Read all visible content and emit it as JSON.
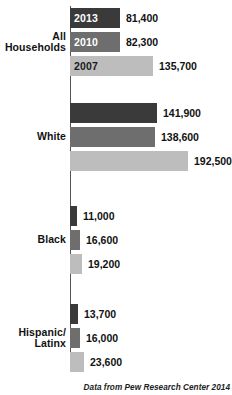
{
  "chart_data": {
    "type": "bar",
    "title": "",
    "xlabel": "",
    "ylabel": "",
    "orientation": "horizontal",
    "grid": false,
    "legend": "none",
    "xlim": [
      0,
      192500
    ],
    "categories": [
      "All Households",
      "White",
      "Black",
      "Hispanic/Latinx"
    ],
    "series": [
      {
        "name": "2013",
        "color": "#3a3a3a",
        "values": [
          81400,
          141900,
          11000,
          13700
        ]
      },
      {
        "name": "2010",
        "color": "#6e6e6e",
        "values": [
          82300,
          138600,
          16600,
          16000
        ]
      },
      {
        "name": "2007",
        "color": "#bdbdbd",
        "values": [
          135700,
          192500,
          19200,
          23600
        ]
      }
    ],
    "source_note": "Data from Pew Research Center 2014"
  },
  "groups": [
    {
      "label_lines": [
        "All",
        "Households"
      ],
      "bars": [
        {
          "year": "2013",
          "value_label": "81,400",
          "value": 81400,
          "color": "#3a3a3a",
          "year_label_color": "#ffffff",
          "show_year": true
        },
        {
          "year": "2010",
          "value_label": "82,300",
          "value": 82300,
          "color": "#6e6e6e",
          "year_label_color": "#ffffff",
          "show_year": true
        },
        {
          "year": "2007",
          "value_label": "135,700",
          "value": 135700,
          "color": "#bdbdbd",
          "year_label_color": "#1a1a1a",
          "show_year": true
        }
      ]
    },
    {
      "label_lines": [
        "White"
      ],
      "bars": [
        {
          "year": "2013",
          "value_label": "141,900",
          "value": 141900,
          "color": "#3a3a3a",
          "year_label_color": "#ffffff",
          "show_year": false
        },
        {
          "year": "2010",
          "value_label": "138,600",
          "value": 138600,
          "color": "#6e6e6e",
          "year_label_color": "#ffffff",
          "show_year": false
        },
        {
          "year": "2007",
          "value_label": "192,500",
          "value": 192500,
          "color": "#bdbdbd",
          "year_label_color": "#1a1a1a",
          "show_year": false
        }
      ]
    },
    {
      "label_lines": [
        "Black"
      ],
      "bars": [
        {
          "year": "2013",
          "value_label": "11,000",
          "value": 11000,
          "color": "#3a3a3a",
          "year_label_color": "#ffffff",
          "show_year": false
        },
        {
          "year": "2010",
          "value_label": "16,600",
          "value": 16600,
          "color": "#6e6e6e",
          "year_label_color": "#ffffff",
          "show_year": false
        },
        {
          "year": "2007",
          "value_label": "19,200",
          "value": 19200,
          "color": "#bdbdbd",
          "year_label_color": "#1a1a1a",
          "show_year": false
        }
      ]
    },
    {
      "label_lines": [
        "Hispanic/",
        "Latinx"
      ],
      "bars": [
        {
          "year": "2013",
          "value_label": "13,700",
          "value": 13700,
          "color": "#3a3a3a",
          "year_label_color": "#ffffff",
          "show_year": false
        },
        {
          "year": "2010",
          "value_label": "16,000",
          "value": 16000,
          "color": "#6e6e6e",
          "year_label_color": "#ffffff",
          "show_year": false
        },
        {
          "year": "2007",
          "value_label": "23,600",
          "value": 23600,
          "color": "#bdbdbd",
          "year_label_color": "#1a1a1a",
          "show_year": false
        }
      ]
    }
  ],
  "footer": {
    "source": "Data from Pew Research Center 2014"
  },
  "layout": {
    "axis_x": 70,
    "max_bar_px": 118,
    "max_value": 192500,
    "group_top_offsets": [
      8,
      103,
      206,
      304
    ]
  }
}
